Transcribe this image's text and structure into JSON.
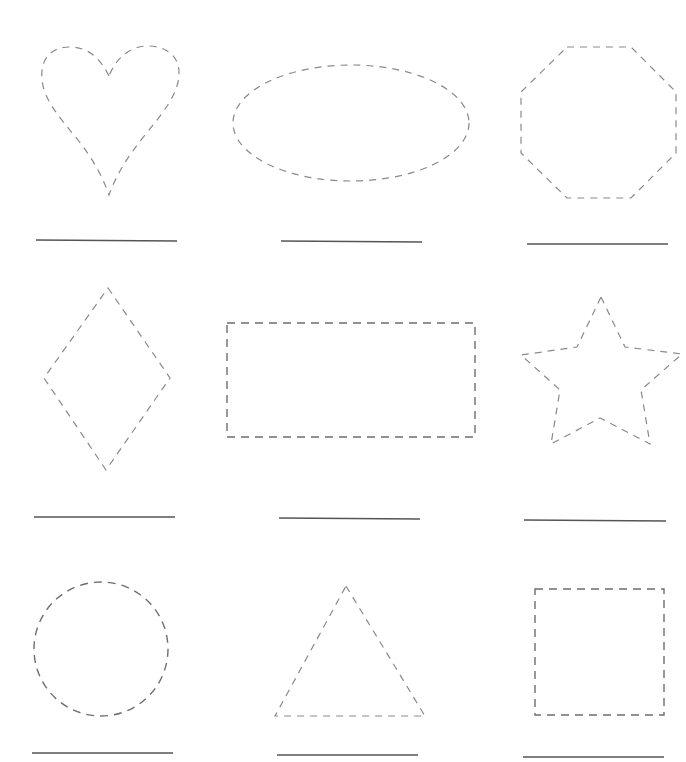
{
  "worksheet": {
    "type": "shape-tracing",
    "rows": 3,
    "columns": 3,
    "colors": {
      "dashed_outline": "#8a8a8a",
      "answer_line": "#555555",
      "background": "#ffffff"
    },
    "shapes": [
      {
        "name": "heart",
        "row": 1,
        "col": 1,
        "answer": ""
      },
      {
        "name": "oval",
        "row": 1,
        "col": 2,
        "answer": ""
      },
      {
        "name": "octagon",
        "row": 1,
        "col": 3,
        "answer": ""
      },
      {
        "name": "diamond",
        "row": 2,
        "col": 1,
        "answer": ""
      },
      {
        "name": "rectangle",
        "row": 2,
        "col": 2,
        "answer": ""
      },
      {
        "name": "star",
        "row": 2,
        "col": 3,
        "answer": ""
      },
      {
        "name": "circle",
        "row": 3,
        "col": 1,
        "answer": ""
      },
      {
        "name": "triangle",
        "row": 3,
        "col": 2,
        "answer": ""
      },
      {
        "name": "square",
        "row": 3,
        "col": 3,
        "answer": ""
      }
    ]
  }
}
